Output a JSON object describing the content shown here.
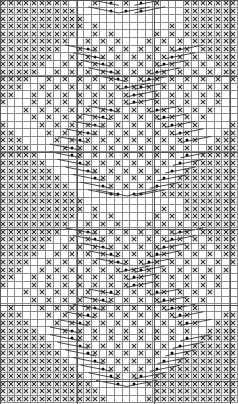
{
  "chart": {
    "type": "knitting-chart",
    "columns": 31,
    "rows": 53,
    "legend": {
      "X": "cross-stitch",
      "o": "bobble-dot",
      ".": "empty"
    },
    "colors": {
      "grid": "#8a8a8a",
      "symbol": "#333333",
      "cross_fill": "#f2f2f2"
    },
    "grid": [
      "XXXXXXXXX...X.o.X.o.X...XXXXXXX",
      "XXXXXXXXXX....o.o.o.....XXXXXXX",
      "XXXXXXXXXXX.............XXXXXXX",
      "XXXXXXXXXXX.X.........X.XXXXXXX",
      "XXXXXXXXXX..X.X.....X.X.XXXXXXX",
      "XXXXXXXXX..X.X.X...X.X.X.XXXXXX",
      "XXXXXXXX..XoX.X.X.X.X.XoX.XXXXX",
      "XXXXXXX..X.XoX.X.X.X.XoX.X.XXXX",
      "XXXXXX..X.X.XoX.X.X.XoX.X.X.XXX",
      "XXXXX..X.X.X.XoX.X.XoX.X.X.X.XX",
      "XXXX..X.X.X.X.XoX.XoX.X.X.X.X.X",
      "XXX..X.X.X.X.X.XoXoX.X.X.X.X.X.",
      "XX..X.X.X.X.X.X.XoX.X.X.X.X.X..",
      "X...X.X.X.X.X.X.XoX.X.X.X.X.X..",
      "...X.X.X.X.X.XoX.X.XoX.X.X.X...",
      "....X.X.X.X.XoX.X.X.XoX.X.X....",
      "X....X.X.X.XoX.X.X.X.XoX.X....X",
      "XX....X.X.XoX.X.X.X.X.XoX....XX",
      "XXX....X.XoX.X.X.X.X.X.XoX..XXX",
      "XXXX....XoX.X.X.X.X.X.X.X..XXXX",
      "XXXXX....oX.X.X.X.X.X.X.o.XXXXX",
      "XXXXXX....oX.X.X.X.X.X.o.XXXXXX",
      "XXXXXXX....oX.X.X.X.X.o.XXXXXXX",
      "XXXXXXXX....oX.X.X.X.o.XXXXXXXX",
      "XXXXXXXXX....oX.X.X.o.XXXXXXXXX",
      "XXXXXXXXXX....oo.oo..XXXXXXXXXX",
      "XXXXXXXXXXX.............XXXXXXX",
      "XXXXXXXXXXX.X........X..XXXXXXX",
      "XXXXXXXXXX..X.X.....X.X.XXXXXXX",
      "XXXXXXXXX..X.X.X...X.X.X.XXXXXX",
      "XXXXXXXX..XoX.X.X.X.X.XoX.XXXXX",
      "XXXXXXX..X.XoX.X.X.X.XoX.X.XXXX",
      "XXXXXX..X.X.XoX.X.X.XoX.X.X.XXX",
      "XXXXX..X.X.X.XoX.X.XoX.X.X.X.XX",
      "XXXX..X.X.X.X.XoX.XoX.X.X.X.X.X",
      "XXX..X.X.X.X.X.XoXoX.X.X.X.X.X.",
      "XX..X.X.X.X.X.X.XoX.X.X.X.X.X..",
      "X...X.X.X.X.X.X.XoX.X.X.X.X.X..",
      "...X.X.X.X.X.XoX.X.XoX.X.X.X...",
      "....X.X.X.X.XoX.X.X.XoX.X.X....",
      ".X...X.X.X.XoX.X.X.X.XoX.X.....",
      "XXX...X.X.XoX.X.X.X.X.XoX....XX",
      "XXXX...X.XoX.X.X.X.X.X.XoX..XXX",
      "XXXXX...XoX.X.X.X.X.X.X.X..XXXX",
      "XXXXXX...oX.X.X.X.X.X.X.o.XXXXX",
      "XXXXXXX...oX.X.X.X.X.X.o.XXXXXX",
      "XXXXXXXX...oX.X.X.X.X.o.XXXXXXX",
      "XXXXXXXXX...oX.X.X.X.o.XXXXXXXX",
      "XXXXXXXXXX...oX.X.X.o.XXXXXXXXX",
      "XXXXXXXXXXX...oX.Xo.XXXXXXXXXXX",
      "XXXXXXXXXXXX...o.o.XXXXXXXXXXXX",
      "XXXXXXXXXXXXX.......XXXXXXXXXXX",
      "XXXXXXXXXXXXXX.....XXXXXXXXXXXX"
    ],
    "major_lines_every": 10
  }
}
